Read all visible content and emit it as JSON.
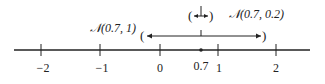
{
  "diagram": {
    "type": "number-line",
    "axis": {
      "ticks": [
        {
          "value": -2,
          "label": "−2"
        },
        {
          "value": -1,
          "label": "−1"
        },
        {
          "value": 0,
          "label": "0"
        },
        {
          "value": 1,
          "label": "1"
        },
        {
          "value": 2,
          "label": "2"
        }
      ],
      "point": {
        "value": 0.7,
        "label": "0.7"
      }
    },
    "intervals": [
      {
        "name": "wide",
        "label": "𝒩(0.7, 1)",
        "center": 0.7,
        "low": -0.3,
        "high": 1.7
      },
      {
        "name": "narrow",
        "label": "𝒩(0.7, 0.2)",
        "center": 0.7,
        "low": 0.5,
        "high": 0.9
      }
    ],
    "colors": {
      "ink": "#222222",
      "background": "#ffffff"
    }
  }
}
